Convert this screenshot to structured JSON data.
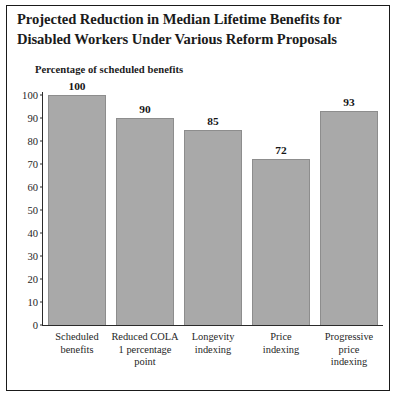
{
  "figure": {
    "title_line1": "Projected Reduction in Median Lifetime Benefits for",
    "title_line2": "Disabled Workers Under Various Reform Proposals",
    "subtitle": "Percentage of scheduled benefits",
    "border_color": "#1a1a1a",
    "bar_fill_color": "#a9a9a9",
    "bar_edge_color": "#8d8d8d",
    "axis_color": "#2b2b2b",
    "background_color": "#ffffff"
  },
  "chart_data": {
    "type": "bar",
    "title": "Projected Reduction in Median Lifetime Benefits for Disabled Workers Under Various Reform Proposals",
    "subtitle": "Percentage of scheduled benefits",
    "xlabel": "",
    "ylabel": "Percentage of scheduled benefits",
    "ylim": [
      0,
      100
    ],
    "yticks": [
      0,
      10,
      20,
      30,
      40,
      50,
      60,
      70,
      80,
      90,
      100
    ],
    "ytick_labels": [
      "0",
      "10",
      "20",
      "30",
      "40",
      "50",
      "60",
      "70",
      "80",
      "90",
      "100"
    ],
    "grid": false,
    "legend": false,
    "categories": [
      "Scheduled benefits",
      "Reduced COLA 1 percentage point",
      "Longevity indexing",
      "Price indexing",
      "Progressive price indexing"
    ],
    "category_label_lines": [
      [
        "Scheduled",
        "benefits"
      ],
      [
        "Reduced COLA",
        "1 percentage",
        "point"
      ],
      [
        "Longevity",
        "indexing"
      ],
      [
        "Price",
        "indexing"
      ],
      [
        "Progressive",
        "price",
        "indexing"
      ]
    ],
    "values": [
      100,
      90,
      85,
      72,
      93
    ],
    "value_labels": [
      "100",
      "90",
      "85",
      "72",
      "93"
    ]
  }
}
